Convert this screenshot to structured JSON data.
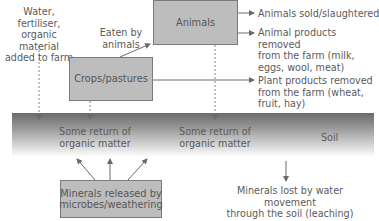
{
  "diagram": {
    "inputs_label": "Water, fertiliser,\norganic material\nadded to farm",
    "eaten_label": "Eaten by\nanimals",
    "boxes": {
      "animals": "Animals",
      "crops": "Crops/pastures",
      "minerals": "Minerals released by\nmicrobes/weathering"
    },
    "outputs": {
      "animals_sold": "Animals sold/slaughtered",
      "animal_products": "Animal products removed\nfrom the farm (milk,\neggs, wool, meat)",
      "plant_products": "Plant products removed\nfrom the farm (wheat,\nfruit, hay)"
    },
    "soil": {
      "label": "Soil",
      "return_left": "Some return of\norganic matter",
      "return_right": "Some return of\norganic matter"
    },
    "leaching_label": "Minerals lost by water movement\nthrough the soil (leaching)"
  }
}
